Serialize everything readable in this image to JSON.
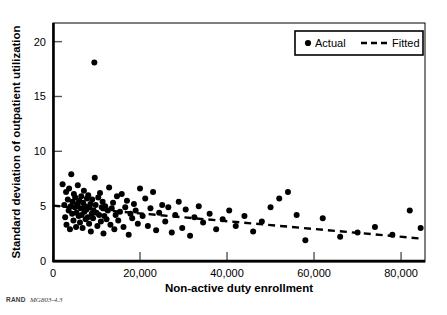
{
  "figure": {
    "source_note_prefix": "RAND",
    "source_note_id": "MG803-4.3"
  },
  "chart_data": {
    "type": "scatter",
    "title": "",
    "subtitle": "",
    "xlabel": "Non-active duty enrollment",
    "ylabel": "Standard deviation of outpatient utilization",
    "xlim": [
      0,
      85500
    ],
    "ylim": [
      0,
      21.7
    ],
    "xticks": [
      0,
      20000,
      40000,
      60000,
      80000
    ],
    "xtick_labels": [
      "0",
      "20,000",
      "40,000",
      "60,000",
      "80,000"
    ],
    "yticks": [
      0,
      5,
      10,
      15,
      20
    ],
    "ytick_labels": [
      "0",
      "5",
      "10",
      "15",
      "20"
    ],
    "grid": false,
    "legend_position": "top-right",
    "marker_color": "#000000",
    "line_color": "#000000",
    "series": [
      {
        "name": "Actual",
        "type": "scatter",
        "marker": "circle",
        "points": [
          [
            2200,
            7.0
          ],
          [
            2600,
            5.1
          ],
          [
            2800,
            4.0
          ],
          [
            3000,
            6.3
          ],
          [
            3100,
            3.3
          ],
          [
            3400,
            5.6
          ],
          [
            3600,
            4.6
          ],
          [
            3700,
            6.6
          ],
          [
            3900,
            2.9
          ],
          [
            4100,
            5.0
          ],
          [
            4200,
            7.9
          ],
          [
            4400,
            4.3
          ],
          [
            4500,
            5.4
          ],
          [
            4700,
            3.7
          ],
          [
            4800,
            6.1
          ],
          [
            5000,
            4.9
          ],
          [
            5100,
            5.8
          ],
          [
            5300,
            3.1
          ],
          [
            5400,
            4.4
          ],
          [
            5600,
            5.2
          ],
          [
            5700,
            6.9
          ],
          [
            5900,
            4.1
          ],
          [
            6000,
            5.5
          ],
          [
            6200,
            3.5
          ],
          [
            6300,
            4.8
          ],
          [
            6500,
            5.9
          ],
          [
            6600,
            4.2
          ],
          [
            6800,
            3.0
          ],
          [
            6900,
            5.3
          ],
          [
            7100,
            6.4
          ],
          [
            7200,
            4.5
          ],
          [
            7400,
            5.0
          ],
          [
            7500,
            3.8
          ],
          [
            7700,
            4.7
          ],
          [
            7800,
            5.7
          ],
          [
            8000,
            4.0
          ],
          [
            8100,
            6.0
          ],
          [
            8300,
            3.4
          ],
          [
            8400,
            4.9
          ],
          [
            8600,
            5.2
          ],
          [
            8700,
            2.7
          ],
          [
            8900,
            4.3
          ],
          [
            9000,
            5.6
          ],
          [
            9200,
            3.9
          ],
          [
            9300,
            4.6
          ],
          [
            9500,
            18.1
          ],
          [
            9600,
            7.6
          ],
          [
            9800,
            5.1
          ],
          [
            10000,
            4.4
          ],
          [
            10200,
            3.2
          ],
          [
            10400,
            5.8
          ],
          [
            10600,
            4.2
          ],
          [
            10800,
            6.2
          ],
          [
            11000,
            3.6
          ],
          [
            11200,
            4.9
          ],
          [
            11400,
            5.4
          ],
          [
            11600,
            2.5
          ],
          [
            11800,
            4.1
          ],
          [
            12000,
            5.0
          ],
          [
            12300,
            3.8
          ],
          [
            12600,
            4.6
          ],
          [
            12900,
            6.7
          ],
          [
            13200,
            3.3
          ],
          [
            13500,
            4.8
          ],
          [
            13800,
            5.3
          ],
          [
            14100,
            2.9
          ],
          [
            14400,
            4.2
          ],
          [
            14700,
            5.9
          ],
          [
            15000,
            3.7
          ],
          [
            15400,
            4.5
          ],
          [
            15800,
            6.1
          ],
          [
            16200,
            3.1
          ],
          [
            16600,
            4.9
          ],
          [
            17000,
            5.5
          ],
          [
            17400,
            2.4
          ],
          [
            17800,
            4.3
          ],
          [
            18200,
            3.9
          ],
          [
            18600,
            5.2
          ],
          [
            19000,
            4.6
          ],
          [
            19500,
            3.4
          ],
          [
            20000,
            6.6
          ],
          [
            20600,
            4.1
          ],
          [
            21200,
            5.7
          ],
          [
            21800,
            3.2
          ],
          [
            22400,
            4.8
          ],
          [
            23000,
            6.3
          ],
          [
            23700,
            2.8
          ],
          [
            24400,
            4.4
          ],
          [
            25100,
            5.1
          ],
          [
            25800,
            3.6
          ],
          [
            26500,
            4.9
          ],
          [
            27300,
            2.6
          ],
          [
            28100,
            4.2
          ],
          [
            28900,
            5.4
          ],
          [
            29700,
            3.0
          ],
          [
            30500,
            4.7
          ],
          [
            31500,
            2.3
          ],
          [
            32500,
            4.0
          ],
          [
            33500,
            5.0
          ],
          [
            34500,
            3.5
          ],
          [
            36000,
            4.3
          ],
          [
            37500,
            2.9
          ],
          [
            39000,
            3.8
          ],
          [
            40500,
            4.6
          ],
          [
            42000,
            3.2
          ],
          [
            44000,
            4.1
          ],
          [
            46000,
            2.7
          ],
          [
            48000,
            3.6
          ],
          [
            50000,
            4.9
          ],
          [
            52000,
            5.7
          ],
          [
            54000,
            6.3
          ],
          [
            56000,
            4.2
          ],
          [
            58000,
            1.9
          ],
          [
            62000,
            3.9
          ],
          [
            66000,
            2.2
          ],
          [
            70000,
            2.6
          ],
          [
            74000,
            3.1
          ],
          [
            78000,
            2.4
          ],
          [
            82000,
            4.6
          ],
          [
            84500,
            3.0
          ]
        ]
      },
      {
        "name": "Fitted",
        "type": "line",
        "style": "dashed",
        "endpoints": [
          [
            0,
            5.05
          ],
          [
            84500,
            2.05
          ]
        ]
      }
    ],
    "legend_entries": [
      {
        "label": "Actual",
        "marker": "circle"
      },
      {
        "label": "Fitted",
        "marker": "dashed-line"
      }
    ]
  }
}
